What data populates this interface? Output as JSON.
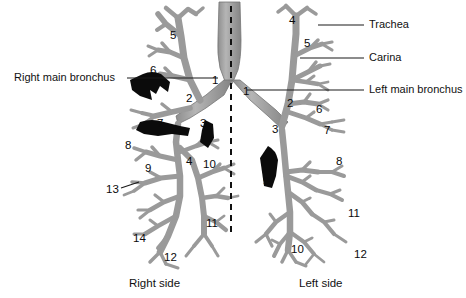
{
  "figure": {
    "colors": {
      "background": "#ffffff",
      "airway_fill": "#9b9b9b",
      "airway_fill_light": "#b0b0b0",
      "airway_stroke": "#6f6f6f",
      "mass_black": "#0b0b0b",
      "leader_line": "#1a1a1a",
      "midline_dash": "#111111",
      "text": "#111111"
    },
    "midline": {
      "name": "midline-dashed",
      "x": 231,
      "y_top": 6,
      "y_bottom": 232,
      "style": "dashed"
    }
  },
  "callouts": [
    {
      "id": "right-main-bronchus",
      "label": "Right main bronchus",
      "text_x": 14,
      "text_y": 72,
      "line_x1": 127,
      "line_x2": 218,
      "line_y": 78,
      "side": "left"
    },
    {
      "id": "trachea",
      "label": "Trachea",
      "text_x": 369,
      "text_y": 19,
      "line_x1": 318,
      "line_x2": 364,
      "line_y": 25,
      "side": "right"
    },
    {
      "id": "carina",
      "label": "Carina",
      "text_x": 369,
      "text_y": 52,
      "line_x1": 300,
      "line_x2": 364,
      "line_y": 58,
      "side": "right"
    },
    {
      "id": "left-main-bronchus",
      "label": "Left main bronchus",
      "text_x": 369,
      "text_y": 84,
      "line_x1": 247,
      "line_x2": 364,
      "line_y": 90,
      "side": "right"
    }
  ],
  "side_captions": [
    {
      "id": "right-side",
      "label": "Right side",
      "x": 129,
      "y": 277
    },
    {
      "id": "left-side",
      "label": "Left side",
      "x": 299,
      "y": 277
    }
  ],
  "numbers_right_lung": [
    {
      "value": "5",
      "x": 170,
      "y": 30
    },
    {
      "value": "6",
      "x": 150,
      "y": 65
    },
    {
      "value": "1",
      "x": 212,
      "y": 75
    },
    {
      "value": "2",
      "x": 186,
      "y": 93
    },
    {
      "value": "3",
      "x": 200,
      "y": 118
    },
    {
      "value": "7",
      "x": 157,
      "y": 118
    },
    {
      "value": "8",
      "x": 125,
      "y": 140
    },
    {
      "value": "9",
      "x": 145,
      "y": 163
    },
    {
      "value": "4",
      "x": 186,
      "y": 156
    },
    {
      "value": "10",
      "x": 203,
      "y": 159
    },
    {
      "value": "13",
      "x": 106,
      "y": 184
    },
    {
      "value": "11",
      "x": 206,
      "y": 218
    },
    {
      "value": "14",
      "x": 133,
      "y": 233
    },
    {
      "value": "12",
      "x": 164,
      "y": 252
    }
  ],
  "numbers_left_lung": [
    {
      "value": "4",
      "x": 289,
      "y": 15
    },
    {
      "value": "5",
      "x": 304,
      "y": 38
    },
    {
      "value": "1",
      "x": 243,
      "y": 86
    },
    {
      "value": "2",
      "x": 287,
      "y": 98
    },
    {
      "value": "6",
      "x": 316,
      "y": 104
    },
    {
      "value": "7",
      "x": 324,
      "y": 125
    },
    {
      "value": "3",
      "x": 272,
      "y": 124
    },
    {
      "value": "8",
      "x": 336,
      "y": 156
    },
    {
      "value": "9",
      "x": 263,
      "y": 176
    },
    {
      "value": "11",
      "x": 348,
      "y": 208
    },
    {
      "value": "10",
      "x": 291,
      "y": 244
    },
    {
      "value": "12",
      "x": 354,
      "y": 249
    }
  ],
  "leader_lines_numbers": [
    {
      "id": "leader-13",
      "x1": 121,
      "y1": 188,
      "x2": 139,
      "y2": 182
    }
  ],
  "masses": [
    {
      "id": "mass-right-upper",
      "description": "black tumor mass near right upper lobe bronchus"
    },
    {
      "id": "mass-right-middle",
      "description": "black tumor mass near right middle lobe bronchus"
    },
    {
      "id": "mass-right-lower",
      "description": "black tumor mass near right lower region"
    },
    {
      "id": "mass-left-lower",
      "description": "black tumor mass on left lower lobe bronchus"
    }
  ]
}
